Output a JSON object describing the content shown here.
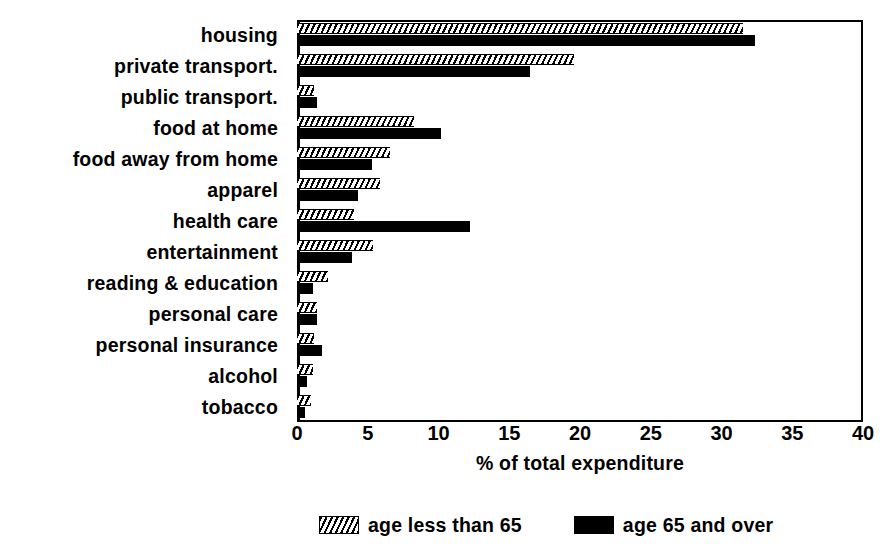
{
  "chart_data": {
    "type": "bar",
    "orientation": "horizontal",
    "title": "",
    "xlabel": "% of total expenditure",
    "ylabel": "",
    "xlim": [
      0,
      40
    ],
    "xticks": [
      0,
      5,
      10,
      15,
      20,
      25,
      30,
      35,
      40
    ],
    "xtick_labels": [
      "0",
      "5",
      "10",
      "15",
      "20",
      "25",
      "30",
      "35",
      "40"
    ],
    "grid": false,
    "legend_position": "bottom",
    "categories": [
      "housing",
      "private transport.",
      "public transport.",
      "food at home",
      "food away from home",
      "apparel",
      "health care",
      "entertainment",
      "reading & education",
      "personal care",
      "personal insurance",
      "alcohol",
      "tobacco"
    ],
    "series": [
      {
        "name": "age less than 65",
        "pattern": "hatched",
        "color": "#000000",
        "values": [
          31.5,
          19.6,
          1.2,
          8.3,
          6.6,
          5.9,
          4.0,
          5.4,
          2.2,
          1.4,
          1.2,
          1.1,
          1.0
        ]
      },
      {
        "name": "age 65 and over",
        "pattern": "solid",
        "color": "#000000",
        "values": [
          32.4,
          16.5,
          1.4,
          10.2,
          5.3,
          4.3,
          12.2,
          3.9,
          1.1,
          1.4,
          1.8,
          0.7,
          0.6
        ]
      }
    ]
  },
  "legend": {
    "items": [
      {
        "label": "age less than 65",
        "swatch": "hatched-swatch"
      },
      {
        "label": "age 65 and over",
        "swatch": "solid-swatch"
      }
    ]
  }
}
